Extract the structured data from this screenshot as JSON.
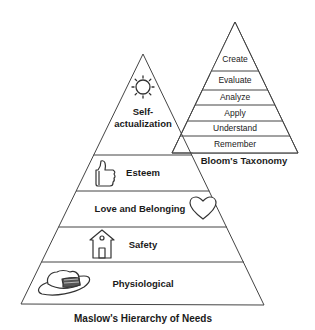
{
  "bloom": {
    "title": "Bloom's Taxonomy",
    "levels": [
      {
        "label": "Create"
      },
      {
        "label": "Evaluate"
      },
      {
        "label": "Analyze"
      },
      {
        "label": "Apply"
      },
      {
        "label": "Understand"
      },
      {
        "label": "Remember"
      }
    ]
  },
  "maslow": {
    "title": "Maslow's Hierarchy of Needs",
    "levels": [
      {
        "label_line1": "Self-",
        "label_line2": "actualization",
        "icon": "sun-icon"
      },
      {
        "label": "Esteem",
        "icon": "thumbs-up-icon"
      },
      {
        "label": "Love and Belonging",
        "icon": "heart-icon"
      },
      {
        "label": "Safety",
        "icon": "house-icon"
      },
      {
        "label": "Physiological",
        "icon": "hat-icon"
      }
    ]
  },
  "colors": {
    "stroke": "#333333",
    "text": "#1a1a1a",
    "background": "#ffffff"
  }
}
